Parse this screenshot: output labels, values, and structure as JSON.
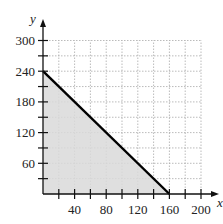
{
  "chart_data": {
    "type": "line",
    "title": "",
    "xlabel": "x",
    "ylabel": "y",
    "xlim": [
      0,
      200
    ],
    "ylim": [
      0,
      300
    ],
    "x_ticks": [
      20,
      40,
      60,
      80,
      100,
      120,
      140,
      160,
      180,
      200
    ],
    "x_tick_labels": [
      "40",
      "80",
      "120",
      "160",
      "200"
    ],
    "x_tick_label_values": [
      40,
      80,
      120,
      160,
      200
    ],
    "y_ticks": [
      30,
      60,
      90,
      120,
      150,
      180,
      210,
      240,
      270,
      300
    ],
    "y_tick_labels": [
      "60",
      "120",
      "180",
      "240",
      "300"
    ],
    "y_tick_label_values": [
      60,
      120,
      180,
      240,
      300
    ],
    "grid": true,
    "series": [
      {
        "name": "boundary line",
        "x": [
          0,
          160
        ],
        "y": [
          240,
          0
        ]
      }
    ],
    "shaded_region": {
      "vertices": [
        [
          0,
          0
        ],
        [
          0,
          240
        ],
        [
          160,
          0
        ]
      ],
      "fill": "#d9d9d9"
    },
    "colors": {
      "line": "#000000",
      "grid": "#aaaaaa",
      "shade": "#d9d9d9"
    }
  }
}
